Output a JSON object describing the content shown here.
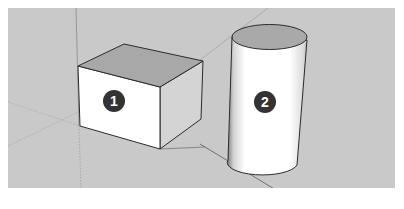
{
  "viewport": {
    "background": "#c9c9c9",
    "frame_background": "#ffffff"
  },
  "axes": {
    "blue_axis_color": "#8a8a8a",
    "red_axis_color": "#5a5a5a",
    "green_axis_color": "#9a9a9a"
  },
  "objects": [
    {
      "type": "box",
      "label": "1",
      "top_face_color": "#a8a8a8",
      "front_face_color": "#ffffff",
      "side_face_color": "#d6d6d6",
      "edge_color": "#2b2b2b"
    },
    {
      "type": "cylinder",
      "label": "2",
      "top_face_color": "#a9a9a9",
      "body_color": "#ffffff",
      "edge_color": "#2b2b2b"
    }
  ],
  "badges": {
    "fill": "#333333",
    "text_color": "#ffffff"
  }
}
